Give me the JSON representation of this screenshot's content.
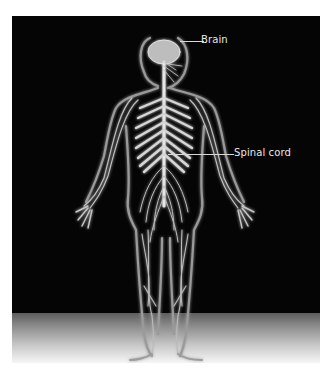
{
  "figure": {
    "background_color": "#050505",
    "floor_gradient": [
      "#5d5d5d",
      "#f6f6f6"
    ],
    "nerve_color": "#d9d9d9"
  },
  "labels": [
    {
      "id": "brain",
      "text": "Brain"
    },
    {
      "id": "spinal_cord",
      "text": "Spinal cord"
    }
  ]
}
